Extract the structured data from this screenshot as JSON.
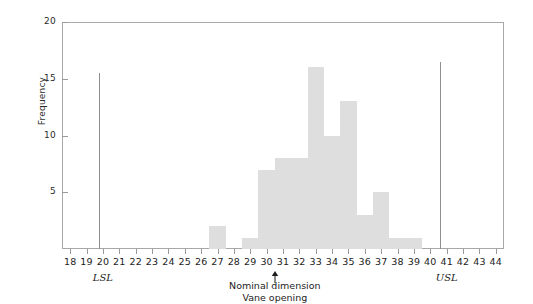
{
  "chart_data": {
    "type": "bar",
    "title": "",
    "subtitle": "",
    "xlabel": "Vane opening",
    "ylabel": "Frequency",
    "grid": false,
    "legend": null,
    "xlim": [
      17.5,
      44.5
    ],
    "ylim": [
      0,
      20
    ],
    "xticks": [
      18,
      19,
      20,
      21,
      22,
      23,
      24,
      25,
      26,
      27,
      28,
      29,
      30,
      31,
      32,
      33,
      34,
      35,
      36,
      37,
      38,
      39,
      40,
      41,
      42,
      43,
      44
    ],
    "yticks": [
      5,
      10,
      15,
      20
    ],
    "categories": [
      18,
      19,
      20,
      21,
      22,
      23,
      24,
      25,
      26,
      27,
      28,
      29,
      30,
      31,
      32,
      33,
      34,
      35,
      36,
      37,
      38,
      39,
      40,
      41,
      42,
      43,
      44
    ],
    "values": [
      0,
      0,
      0,
      0,
      0,
      0,
      0,
      0,
      0,
      2,
      0,
      1,
      7,
      8,
      8,
      16,
      10,
      13,
      3,
      5,
      1,
      1,
      0,
      0,
      0,
      0,
      0
    ],
    "bar_color": "#dedede",
    "bar_width": 1,
    "annotations": [
      {
        "name": "lsl-line",
        "type": "vline",
        "x": 19.75,
        "y_top": 15.5,
        "label": "LSL",
        "label_x": 20
      },
      {
        "name": "usl-line",
        "type": "vline",
        "x": 40.6,
        "y_top": 16.5,
        "label": "USL",
        "label_x": 41
      },
      {
        "name": "nominal-arrow",
        "type": "arrow",
        "x": 30.5,
        "text_line1": "Nominal dimension",
        "text_line2": "Vane opening"
      }
    ]
  },
  "axes": {
    "y_label": "Frequency",
    "y_ticks": [
      {
        "value": 20,
        "label": "20"
      },
      {
        "value": 15,
        "label": "15"
      },
      {
        "value": 10,
        "label": "10"
      },
      {
        "value": 5,
        "label": "5"
      }
    ],
    "x_ticks": [
      {
        "value": 18,
        "label": "18"
      },
      {
        "value": 19,
        "label": "19"
      },
      {
        "value": 20,
        "label": "20"
      },
      {
        "value": 21,
        "label": "21"
      },
      {
        "value": 22,
        "label": "22"
      },
      {
        "value": 23,
        "label": "23"
      },
      {
        "value": 24,
        "label": "24"
      },
      {
        "value": 25,
        "label": "25"
      },
      {
        "value": 26,
        "label": "26"
      },
      {
        "value": 27,
        "label": "27"
      },
      {
        "value": 28,
        "label": "28"
      },
      {
        "value": 29,
        "label": "29"
      },
      {
        "value": 30,
        "label": "30"
      },
      {
        "value": 31,
        "label": "31"
      },
      {
        "value": 32,
        "label": "32"
      },
      {
        "value": 33,
        "label": "33"
      },
      {
        "value": 34,
        "label": "34"
      },
      {
        "value": 35,
        "label": "35"
      },
      {
        "value": 36,
        "label": "36"
      },
      {
        "value": 37,
        "label": "37"
      },
      {
        "value": 38,
        "label": "38"
      },
      {
        "value": 39,
        "label": "39"
      },
      {
        "value": 40,
        "label": "40"
      },
      {
        "value": 41,
        "label": "41"
      },
      {
        "value": 42,
        "label": "42"
      },
      {
        "value": 43,
        "label": "43"
      },
      {
        "value": 44,
        "label": "44"
      }
    ]
  },
  "labels": {
    "lsl": "LSL",
    "usl": "USL",
    "nominal_line1": "Nominal dimension",
    "nominal_line2": "Vane opening"
  },
  "colors": {
    "bar": "#dedede",
    "frame": "#a8a8a8",
    "spec_line": "#8e8e8e",
    "text": "#1c1c1c",
    "background": "#ffffff"
  }
}
